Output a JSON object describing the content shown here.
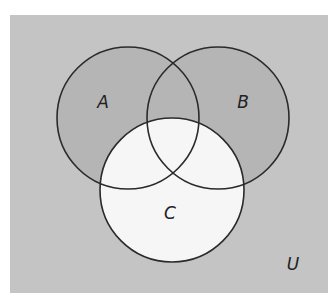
{
  "diagram": {
    "type": "venn",
    "universe": {
      "label": "U",
      "fill": "#c4c4c4",
      "rect": {
        "x": 10,
        "y": 15,
        "width": 318,
        "height": 278
      },
      "label_pos": {
        "x": 293,
        "y": 270
      }
    },
    "sets": [
      {
        "id": "A",
        "label": "A",
        "shaded": true,
        "fill": "#b5b5b5",
        "circle": {
          "cx": 128,
          "cy": 118,
          "r": 71
        },
        "label_pos": {
          "x": 103,
          "y": 108
        }
      },
      {
        "id": "B",
        "label": "B",
        "shaded": true,
        "fill": "#b5b5b5",
        "circle": {
          "cx": 218,
          "cy": 118,
          "r": 71
        },
        "label_pos": {
          "x": 243,
          "y": 108
        }
      },
      {
        "id": "C",
        "label": "C",
        "shaded": false,
        "fill": "#f6f6f6",
        "circle": {
          "cx": 172,
          "cy": 190,
          "r": 72
        },
        "label_pos": {
          "x": 170,
          "y": 219
        }
      }
    ],
    "stroke": "#2a2a2a",
    "shaded_region_description": "(A ∪ B) − C"
  }
}
